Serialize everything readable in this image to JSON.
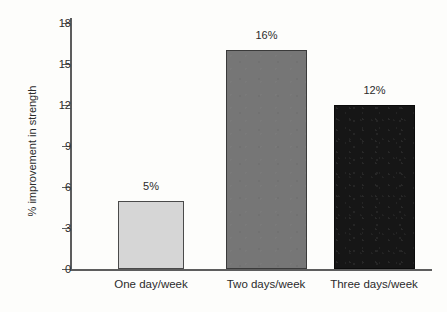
{
  "chart_data": {
    "type": "bar",
    "title": "",
    "xlabel": "",
    "ylabel": "% improvement in strength",
    "categories": [
      "One day/week",
      "Two days/week",
      "Three days/week"
    ],
    "values": [
      5,
      16,
      12
    ],
    "data_labels": [
      "5%",
      "16%",
      "12%"
    ],
    "ylim": [
      0,
      18
    ],
    "yticks": [
      0,
      3,
      6,
      9,
      12,
      15,
      18
    ],
    "ytick_labels": [
      "0",
      "3",
      "6",
      "9",
      "12",
      "15",
      "18"
    ],
    "grid": false,
    "legend": "none",
    "bar_colors": [
      "#d6d6d6",
      "#767676",
      "#161616"
    ],
    "axis_color": "#5d5d5d",
    "text_color": "#2b2b2b",
    "background": "#fdfdfb"
  }
}
